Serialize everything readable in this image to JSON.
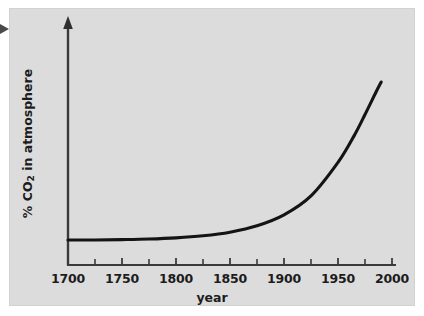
{
  "figure": {
    "background_color": "#dcdcdc",
    "page_background_color": "#ffffff",
    "curve_color": "#141414",
    "axis_color": "#3a3a3a",
    "text_color": "#1c1c1c",
    "left_pointer_icon": "triangle-right-marker"
  },
  "chart_data": {
    "type": "line",
    "title": "",
    "subtitle": "",
    "xlabel": "year",
    "ylabel_plain": "% CO2 in atmosphere",
    "ylabel_prefix": "% CO",
    "ylabel_subscript": "2",
    "ylabel_suffix": " in atmosphere",
    "grid": false,
    "legend": null,
    "legend_position": "none",
    "xlim": [
      1700,
      2010
    ],
    "ylim": [
      0,
      1
    ],
    "y_axis_ticks_labeled": false,
    "y_axis_has_arrowhead": true,
    "x_tick_labels": [
      "1700",
      "1750",
      "1800",
      "1850",
      "1900",
      "1950",
      "2000"
    ],
    "x_tick_values": [
      1700,
      1750,
      1800,
      1850,
      1900,
      1950,
      2000
    ],
    "x_minor_tick_values": [
      1725,
      1775,
      1825,
      1875,
      1925,
      1975
    ],
    "x_tick_interval_years": 25,
    "annotations": [],
    "series": [
      {
        "name": "% CO2 in atmosphere",
        "x": [
          1700,
          1725,
          1750,
          1775,
          1800,
          1825,
          1850,
          1875,
          1900,
          1925,
          1950,
          1965,
          1975,
          1985,
          1990
        ],
        "values": [
          0.155,
          0.155,
          0.157,
          0.16,
          0.166,
          0.177,
          0.196,
          0.229,
          0.286,
          0.385,
          0.56,
          0.7,
          0.81,
          0.925,
          0.98
        ]
      }
    ]
  }
}
